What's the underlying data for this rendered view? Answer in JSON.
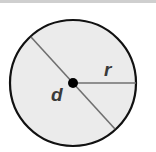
{
  "diagram": {
    "title": "",
    "shape": "circle",
    "labels": {
      "diameter": "d",
      "radius": "r"
    },
    "colors": {
      "fill": "#ebebeb",
      "outline": "#111111",
      "lines": "#707070",
      "center_dot": "#000000",
      "label": "#3a3a3a",
      "top_rule": "#cfcfcf"
    },
    "geometry": {
      "center": [
        73,
        83
      ],
      "radius": 63
    }
  }
}
